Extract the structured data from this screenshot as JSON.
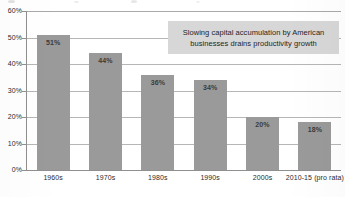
{
  "chart_data": {
    "type": "bar",
    "title": "",
    "xlabel": "",
    "ylabel": "",
    "categories": [
      "1960s",
      "1970s",
      "1980s",
      "1990s",
      "2000s",
      "2010-15 (pro rata)"
    ],
    "values": [
      51,
      44,
      36,
      34,
      20,
      18
    ],
    "value_labels": [
      "51%",
      "44%",
      "36%",
      "34%",
      "20%",
      "18%"
    ],
    "ylim": [
      0,
      60
    ],
    "ytick_labels": [
      "60%",
      "50%",
      "40%",
      "30%",
      "20%",
      "10%",
      "0%"
    ],
    "ytick_values": [
      60,
      50,
      40,
      30,
      20,
      10,
      0
    ],
    "grid": true,
    "legend": "none",
    "units": "percent",
    "series": [
      {
        "name": "",
        "values": [
          51,
          44,
          36,
          34,
          20,
          18
        ]
      }
    ],
    "annotations": [
      {
        "name": "callout",
        "lines": [
          "Slowing capital accumulation by American",
          "businesses drains productivity growth"
        ],
        "position": "top-right"
      }
    ],
    "colors": {
      "bar": "#9a9a9a",
      "bar_label_text": "#3a3a3a",
      "gridline": "#b6b6b6",
      "axis": "#8f8f8f",
      "callout_background": "#d7d7d7",
      "callout_text": "#1f1f1f",
      "axis_label_text": "#2b2b2b",
      "background": "#ffffff"
    }
  }
}
